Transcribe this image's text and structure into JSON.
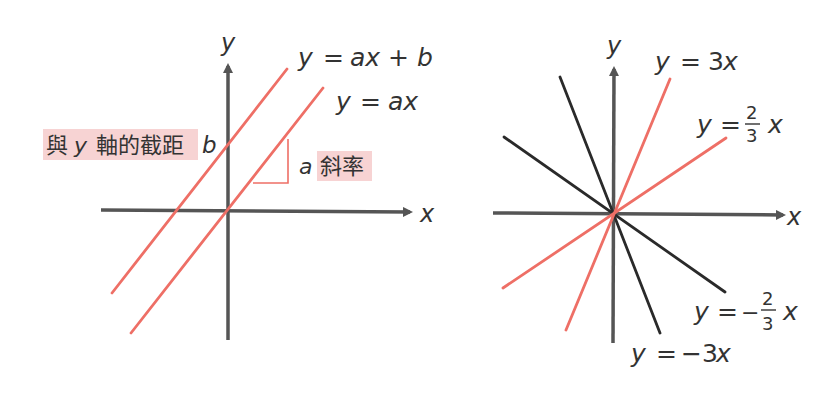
{
  "colors": {
    "axis": "#555555",
    "red_line": "#ee6f66",
    "black_line": "#2a2a2a",
    "highlight": "#f7d3d3",
    "text": "#333333"
  },
  "left_graph": {
    "x_axis_label": "x",
    "y_axis_label": "y",
    "line_intercept": {
      "label_lhs": "y",
      "label_eq": "=",
      "label_rhs": "ax + b"
    },
    "line_origin": {
      "label_lhs": "y",
      "label_eq": "=",
      "label_rhs": "ax"
    },
    "intercept_label": {
      "text_pre": "與",
      "text_var": "y",
      "text_post": "軸的截距",
      "var_b": "b"
    },
    "slope_label": {
      "var_a": "a",
      "text": "斜率"
    }
  },
  "right_graph": {
    "x_axis_label": "x",
    "y_axis_label": "y",
    "lines": [
      {
        "id": "y-eq-3x",
        "lhs": "y",
        "eq": "=",
        "coef": "3",
        "var": "x",
        "color": "red"
      },
      {
        "id": "y-eq-2-3x",
        "lhs": "y",
        "eq": "=",
        "numerator": "2",
        "denominator": "3",
        "var": "x",
        "color": "red"
      },
      {
        "id": "y-eq-neg-2-3x",
        "lhs": "y",
        "eq": "=",
        "sign": "−",
        "numerator": "2",
        "denominator": "3",
        "var": "x",
        "color": "black"
      },
      {
        "id": "y-eq-neg-3x",
        "lhs": "y",
        "eq": "=",
        "coef": "−3",
        "var": "x",
        "color": "black"
      }
    ]
  }
}
